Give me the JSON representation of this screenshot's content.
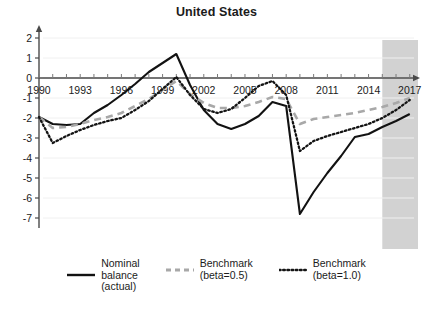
{
  "chart_data": {
    "type": "line",
    "title": "United States",
    "xlabel": "",
    "ylabel": "",
    "xlim": [
      1990,
      2017.6
    ],
    "ylim": [
      -7.5,
      2.4
    ],
    "yticks": [
      2,
      1,
      0,
      -1,
      -2,
      -3,
      -4,
      -5,
      -6,
      -7
    ],
    "ytick_labels": [
      "2",
      "1",
      "0",
      "-1",
      "-2",
      "-3",
      "-4",
      "-5",
      "-6",
      "-7"
    ],
    "xticks": [
      1990,
      1993,
      1996,
      1999,
      2002,
      2005,
      2008,
      2011,
      2014,
      2017
    ],
    "xtick_labels": [
      "1990",
      "1993",
      "1996",
      "1999",
      "2002",
      "2005",
      "2008",
      "2011",
      "2014",
      "2017"
    ],
    "minor_xticks_every": 1,
    "grid": false,
    "legend_position": "below",
    "shaded_region": {
      "label": "projection",
      "x_start": 2015,
      "x_end": 2017.6,
      "color": "#d2d2d2"
    },
    "x": [
      1990,
      1991,
      1992,
      1993,
      1994,
      1995,
      1996,
      1997,
      1998,
      1999,
      2000,
      2001,
      2002,
      2003,
      2004,
      2005,
      2006,
      2007,
      2008,
      2009,
      2010,
      2011,
      2012,
      2013,
      2014,
      2015,
      2016,
      2017
    ],
    "series": [
      {
        "name": "Nominal balance (actual)",
        "style": "solid",
        "color": "#121212",
        "values": [
          -1.95,
          -2.3,
          -2.35,
          -2.3,
          -1.75,
          -1.35,
          -0.85,
          -0.3,
          0.3,
          0.75,
          1.2,
          -0.35,
          -1.6,
          -2.3,
          -2.55,
          -2.3,
          -1.9,
          -1.2,
          -1.4,
          -6.8,
          -5.7,
          -4.75,
          -3.9,
          -2.95,
          -2.8,
          -2.45,
          -2.15,
          -1.8
        ]
      },
      {
        "name": "Benchmark (beta=0.5)",
        "style": "dashed",
        "color": "#a8a8a8",
        "values": [
          -1.95,
          -2.5,
          -2.45,
          -2.3,
          -2.1,
          -1.95,
          -1.75,
          -1.4,
          -1.05,
          -0.6,
          -0.15,
          -0.8,
          -1.25,
          -1.5,
          -1.5,
          -1.4,
          -1.2,
          -0.95,
          -1.05,
          -2.3,
          -2.05,
          -1.95,
          -1.85,
          -1.75,
          -1.6,
          -1.45,
          -1.25,
          -1.0
        ]
      },
      {
        "name": "Benchmark (beta=1.0)",
        "style": "dotted",
        "color": "#141414",
        "values": [
          -1.95,
          -3.25,
          -2.9,
          -2.6,
          -2.35,
          -2.15,
          -2.0,
          -1.6,
          -1.15,
          -0.55,
          0.05,
          -0.85,
          -1.55,
          -1.75,
          -1.55,
          -1.0,
          -0.4,
          -0.15,
          -0.85,
          -3.65,
          -3.15,
          -2.9,
          -2.7,
          -2.5,
          -2.3,
          -2.0,
          -1.6,
          -1.1
        ]
      }
    ]
  },
  "legend": {
    "entries": [
      {
        "label": "Nominal\nbalance\n(actual)",
        "style": "solid",
        "color": "#121212"
      },
      {
        "label": "Benchmark\n(beta=0.5)",
        "style": "dashed",
        "color": "#a8a8a8"
      },
      {
        "label": "Benchmark\n(beta=1.0)",
        "style": "dotted",
        "color": "#141414"
      }
    ]
  }
}
